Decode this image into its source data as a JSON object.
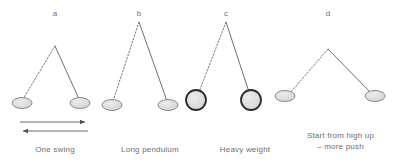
{
  "figure": {
    "background_color": "#ffffff",
    "text_color": "#6e6e6e",
    "line_color": "#6f6f6f",
    "bob_fill": "#dcdcdc",
    "bob_stroke": "#8c8c8c",
    "heavy_bob_stroke": "#2b2b2b",
    "arrow_color": "#5a5a5a"
  },
  "panels": [
    {
      "letter": "a",
      "caption": "One swing",
      "pivot": {
        "x": 55,
        "y": 46
      },
      "bob_left": {
        "x": 22,
        "y": 103,
        "rx": 10,
        "ry": 5.5
      },
      "bob_right": {
        "x": 80,
        "y": 103,
        "rx": 10,
        "ry": 5.5
      },
      "rod_left_style": "dotted",
      "rod_right_style": "solid",
      "bob_style": "light",
      "arrows": [
        {
          "direction": "right",
          "x1": 20,
          "x2": 88,
          "y": 122
        },
        {
          "direction": "left",
          "x1": 88,
          "x2": 20,
          "y": 131
        }
      ]
    },
    {
      "letter": "b",
      "caption": "Long pendulum",
      "pivot": {
        "x": 139,
        "y": 22
      },
      "bob_left": {
        "x": 112,
        "y": 105,
        "rx": 10,
        "ry": 5.5
      },
      "bob_right": {
        "x": 168,
        "y": 105,
        "rx": 10,
        "ry": 5.5
      },
      "rod_left_style": "dotted",
      "rod_right_style": "solid",
      "bob_style": "light",
      "arrows": []
    },
    {
      "letter": "c",
      "caption": "Heavy weight",
      "pivot": {
        "x": 226,
        "y": 22
      },
      "bob_left": {
        "x": 196,
        "y": 100,
        "rx": 10.5,
        "ry": 10.5
      },
      "bob_right": {
        "x": 251,
        "y": 100,
        "rx": 10.5,
        "ry": 10.5
      },
      "rod_left_style": "dotted",
      "rod_right_style": "solid",
      "bob_style": "heavy",
      "arrows": []
    },
    {
      "letter": "d",
      "caption": "Start from high up\n– more push",
      "pivot": {
        "x": 328,
        "y": 49
      },
      "bob_left": {
        "x": 285,
        "y": 96,
        "rx": 10,
        "ry": 5.5
      },
      "bob_right": {
        "x": 375,
        "y": 96,
        "rx": 10,
        "ry": 5.5
      },
      "rod_left_style": "dotted",
      "rod_right_style": "solid",
      "bob_style": "light",
      "arrows": []
    }
  ]
}
